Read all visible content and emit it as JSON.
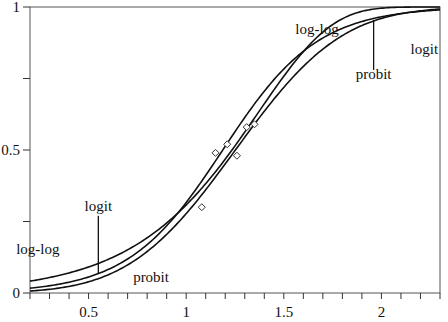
{
  "chart_data": {
    "type": "line",
    "title": "",
    "xlabel": "",
    "ylabel": "",
    "xlim": [
      0.2,
      2.3
    ],
    "ylim": [
      0,
      1
    ],
    "grid": false,
    "x_ticks": [
      0.5,
      1,
      1.5,
      2
    ],
    "x_tick_labels": [
      "0.5",
      "1",
      "1.5",
      "2"
    ],
    "x_minor_step": 0.1,
    "y_ticks": [
      0,
      0.25,
      0.5,
      0.75,
      1
    ],
    "y_tick_labels": [
      "0",
      "",
      "0.5",
      "",
      "1"
    ],
    "series": [
      {
        "name": "logit",
        "link": "logit",
        "intercept": -4.88,
        "slope": 4.11
      },
      {
        "name": "probit",
        "link": "probit",
        "intercept": -2.93,
        "slope": 2.34
      },
      {
        "name": "log-log",
        "link": "cloglog",
        "intercept": -3.7,
        "slope": 2.7
      }
    ],
    "points": [
      {
        "x": 1.08,
        "y": 0.3
      },
      {
        "x": 1.15,
        "y": 0.49
      },
      {
        "x": 1.21,
        "y": 0.52
      },
      {
        "x": 1.26,
        "y": 0.48
      },
      {
        "x": 1.31,
        "y": 0.58
      },
      {
        "x": 1.35,
        "y": 0.59
      }
    ],
    "annotations": [
      {
        "text": "log-log",
        "x": 1.67,
        "y": 0.905,
        "line": null
      },
      {
        "text": "probit",
        "x": 1.96,
        "y": 0.75,
        "line": {
          "x": 1.96,
          "y1": 0.78,
          "y2": 0.955
        }
      },
      {
        "text": "logit",
        "x": 2.22,
        "y": 0.835,
        "line": null
      },
      {
        "text": "logit",
        "x": 0.55,
        "y": 0.285,
        "line": {
          "x": 0.55,
          "y1": 0.07,
          "y2": 0.27
        }
      },
      {
        "text": "log-log",
        "x": 0.24,
        "y": 0.135,
        "line": null
      },
      {
        "text": "probit",
        "x": 0.82,
        "y": 0.04,
        "line": null
      }
    ]
  }
}
